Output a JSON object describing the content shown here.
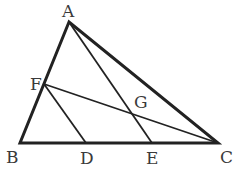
{
  "diagram": {
    "type": "geometry-triangle",
    "points": {
      "A": {
        "label": "A",
        "x": 69,
        "y": 22
      },
      "B": {
        "label": "B",
        "x": 20,
        "y": 143
      },
      "C": {
        "label": "C",
        "x": 218,
        "y": 143
      },
      "D": {
        "label": "D",
        "x": 86,
        "y": 143
      },
      "E": {
        "label": "E",
        "x": 152,
        "y": 143
      },
      "F": {
        "label": "F",
        "x": 44,
        "y": 84
      },
      "G": {
        "label": "G",
        "x": 132,
        "y": 113
      }
    },
    "segments": [
      [
        "A",
        "B"
      ],
      [
        "B",
        "C"
      ],
      [
        "C",
        "A"
      ],
      [
        "F",
        "D"
      ],
      [
        "F",
        "C"
      ],
      [
        "A",
        "E"
      ]
    ],
    "colors": {
      "line": "#222222",
      "text": "#3a3a3a"
    }
  }
}
